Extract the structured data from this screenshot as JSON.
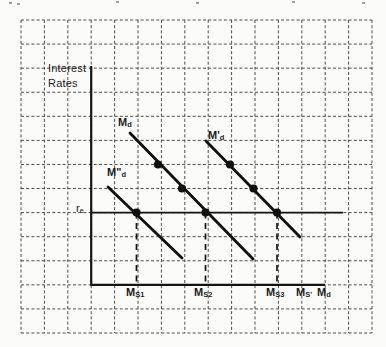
{
  "page": {
    "background": "#fbfbf9",
    "ink": "#141414",
    "grid_color": "#4c4c4c"
  },
  "figure": {
    "y_axis_label": {
      "line1": "Interest",
      "line2": "Rates"
    },
    "equilibrium_label": {
      "base": "r",
      "sub": "e"
    },
    "curve_labels": {
      "md": {
        "base": "M",
        "sub": "d"
      },
      "md_prime": {
        "base": "M'",
        "sub": "d"
      },
      "md_double_prime": {
        "base": "M\"",
        "sub": "d"
      }
    },
    "x_axis_labels": [
      {
        "base": "M",
        "sub": "S1"
      },
      {
        "base": "M",
        "sub": "S2"
      },
      {
        "base": "M",
        "sub": "S3"
      },
      {
        "base": "M",
        "sub": "S'"
      },
      {
        "base": "M",
        "sub": "d"
      }
    ]
  },
  "diagram": {
    "width": 386,
    "height": 347,
    "grid": {
      "x_start": 21,
      "x_end": 372,
      "x_lines": 16,
      "y_start": 20,
      "y_end": 333,
      "y_lines": 14
    },
    "axes": {
      "y_axis": {
        "x": 91.2,
        "y1": 66,
        "y2": 285.8
      },
      "x_axis": {
        "y": 284.8,
        "x1": 91.2,
        "x2": 325
      }
    },
    "equilibrium_line": {
      "y": 212.6,
      "x1": 91.2,
      "x2": 343
    },
    "demand_curves": [
      {
        "id": "curve-md-double-prime",
        "x1": 108,
        "y1": 187,
        "x2": 182,
        "y2": 258,
        "dots": [
          [
            136.5,
            212.6
          ]
        ]
      },
      {
        "id": "curve-md",
        "x1": 130,
        "y1": 133,
        "x2": 253,
        "y2": 259,
        "dots": [
          [
            158,
            164.5
          ],
          [
            182,
            188.5
          ],
          [
            205.5,
            212.6
          ]
        ]
      },
      {
        "id": "curve-md-prime",
        "x1": 206,
        "y1": 141,
        "x2": 300,
        "y2": 237,
        "dots": [
          [
            230,
            164.5
          ],
          [
            253.5,
            188.5
          ],
          [
            277,
            212.6
          ]
        ]
      }
    ],
    "supply_droplines": [
      {
        "x": 136.5
      },
      {
        "x": 205.5
      },
      {
        "x": 277
      }
    ],
    "dropline_y1": 212.6,
    "dropline_y2": 284.8,
    "dot_radius": 4.1,
    "scan_artifacts": [
      [
        9,
        2
      ],
      [
        17,
        3
      ],
      [
        116,
        1
      ],
      [
        196,
        2
      ],
      [
        292,
        1
      ],
      [
        362,
        2
      ]
    ]
  }
}
